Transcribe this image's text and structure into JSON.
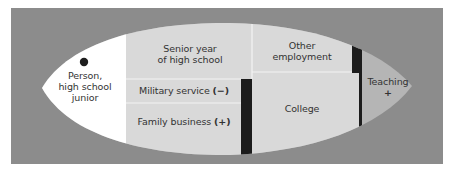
{
  "diagram": {
    "colors": {
      "background": "#8c8c8c",
      "start_region": "#ffffff",
      "options": "#d9d9d9",
      "teaching_region": "#b5b5b5",
      "barrier": "#1c1c1c",
      "divider": "#f2f2f2",
      "text": "#333333"
    },
    "person": {
      "label_line1": "Person,",
      "label_line2": "high school",
      "label_line3": "junior"
    },
    "regions": {
      "senior_year": {
        "line1": "Senior year",
        "line2": "of high school"
      },
      "military": {
        "label": "Military service",
        "valence": "(−)"
      },
      "family_business": {
        "label": "Family business",
        "valence": "(+)"
      },
      "other_employment": {
        "line1": "Other",
        "line2": "employment"
      },
      "college": {
        "label": "College"
      },
      "teaching": {
        "label": "Teaching",
        "valence": "+"
      }
    }
  }
}
